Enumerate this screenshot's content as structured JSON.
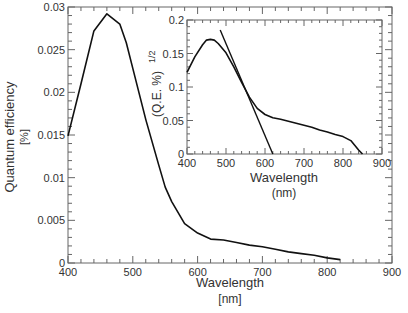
{
  "chart_data": [
    {
      "id": "main",
      "type": "line",
      "title": "",
      "xlabel": "Wavelength",
      "xunit": "[nm]",
      "ylabel": "Quantum efficiency",
      "yunit": "[%]",
      "xlim": [
        400,
        900
      ],
      "ylim": [
        0,
        0.03
      ],
      "xticks": [
        400,
        500,
        600,
        700,
        800,
        900
      ],
      "xtick_labels": [
        "400",
        "500",
        "600",
        "700",
        "800",
        "900"
      ],
      "yticks": [
        0,
        0.005,
        0.01,
        0.015,
        0.02,
        0.025,
        0.03
      ],
      "ytick_labels": [
        "0",
        "0.005",
        "0.01",
        "0.015",
        "0.02",
        "0.025",
        "0.03"
      ],
      "grid": false,
      "series": [
        {
          "name": "quantum-efficiency",
          "x": [
            400,
            420,
            440,
            460,
            480,
            490,
            500,
            520,
            540,
            550,
            560,
            580,
            600,
            620,
            640,
            660,
            680,
            700,
            720,
            740,
            760,
            780,
            800,
            820
          ],
          "y": [
            0.0149,
            0.021,
            0.0272,
            0.0292,
            0.028,
            0.0258,
            0.0228,
            0.0168,
            0.0115,
            0.0089,
            0.0072,
            0.0046,
            0.0035,
            0.0028,
            0.0027,
            0.0024,
            0.0021,
            0.0019,
            0.0016,
            0.0013,
            0.0011,
            0.0009,
            0.0006,
            0.0004
          ]
        }
      ]
    },
    {
      "id": "inset",
      "type": "line",
      "title": "",
      "xlabel": "Wavelength",
      "xunit": "(nm)",
      "ylabel": "(Q.E. %)",
      "ylabel_superscript": "1/2",
      "xlim": [
        400,
        900
      ],
      "ylim": [
        0,
        0.2
      ],
      "xticks": [
        400,
        500,
        600,
        700,
        800,
        900
      ],
      "xtick_labels": [
        "400",
        "500",
        "600",
        "700",
        "800",
        "900"
      ],
      "yticks": [
        0,
        0.05,
        0.1,
        0.15,
        0.2
      ],
      "ytick_labels": [
        "0",
        "0.05",
        "0.1",
        "0.15",
        "0.2"
      ],
      "grid": false,
      "series": [
        {
          "name": "sqrt-quantum-efficiency",
          "x": [
            400,
            420,
            440,
            450,
            460,
            470,
            480,
            500,
            520,
            540,
            560,
            580,
            600,
            620,
            640,
            660,
            680,
            700,
            720,
            740,
            760,
            780,
            800,
            820,
            840,
            850
          ],
          "y": [
            0.122,
            0.145,
            0.163,
            0.17,
            0.171,
            0.17,
            0.165,
            0.151,
            0.13,
            0.107,
            0.085,
            0.068,
            0.059,
            0.054,
            0.052,
            0.049,
            0.046,
            0.043,
            0.04,
            0.036,
            0.033,
            0.029,
            0.026,
            0.02,
            0.006,
            0.0
          ]
        },
        {
          "name": "linear-fit",
          "x": [
            485,
            620
          ],
          "y": [
            0.185,
            0.0
          ]
        }
      ]
    }
  ]
}
